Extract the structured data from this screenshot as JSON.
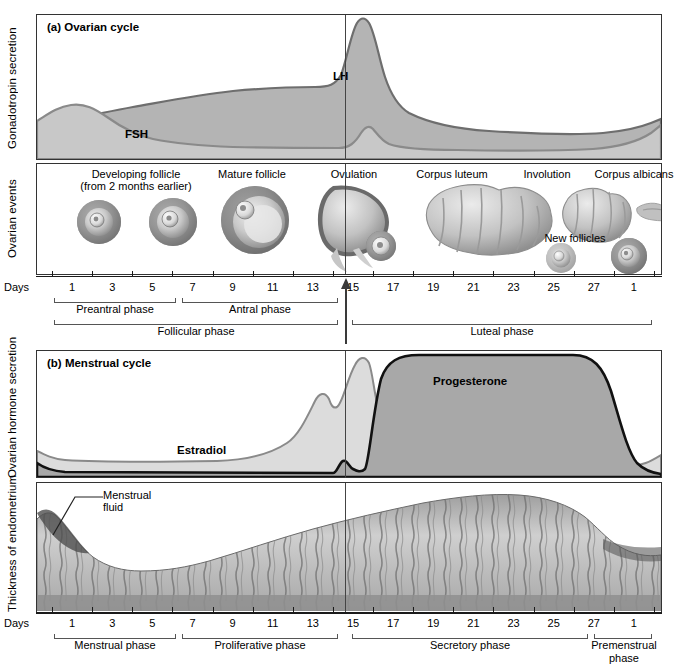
{
  "figure": {
    "type": "physiology-diagram",
    "panels": [
      {
        "id": "a",
        "label": "(a) Ovarian cycle"
      },
      {
        "id": "b",
        "label": "(b) Menstrual cycle"
      }
    ]
  },
  "axes": {
    "y_gonadotropin": "Gonadotropin secretion",
    "y_ovarian_events": "Ovarian events",
    "y_ovarian_hormone": "Ovarian hormone secretion",
    "y_endometrium": "Thickness of endometrium",
    "days_word": "Days",
    "day_ticks": [
      1,
      3,
      5,
      7,
      9,
      11,
      13,
      15,
      17,
      19,
      21,
      23,
      25,
      27,
      1
    ],
    "ovulation_day": 14
  },
  "panel_a": {
    "title": "(a) Ovarian cycle",
    "curves": [
      {
        "name": "LH",
        "label": "LH",
        "fill": "#b4b4b4",
        "stroke": "#6e6e6e"
      },
      {
        "name": "FSH",
        "label": "FSH",
        "fill": "#c8c8c8",
        "stroke": "#8a8a8a"
      }
    ],
    "events": [
      {
        "label": "Developing follicle",
        "sublabel": "(from 2 months earlier)"
      },
      {
        "label": "Mature follicle"
      },
      {
        "label": "Ovulation"
      },
      {
        "label": "Corpus luteum"
      },
      {
        "label": "Involution"
      },
      {
        "label": "Corpus albicans"
      },
      {
        "label": "New follicles"
      }
    ],
    "phases": [
      {
        "label": "Preantral phase",
        "start_day": 1,
        "end_day": 5
      },
      {
        "label": "Antral phase",
        "start_day": 6,
        "end_day": 13
      },
      {
        "label": "Follicular phase",
        "start_day": 1,
        "end_day": 13
      },
      {
        "label": "Luteal phase",
        "start_day": 15,
        "end_day": 28
      }
    ]
  },
  "panel_b": {
    "title": "(b) Menstrual cycle",
    "curves": [
      {
        "name": "Estradiol",
        "label": "Estradiol",
        "fill": "#dcdcdc",
        "stroke": "#8a8a8a"
      },
      {
        "name": "Progesterone",
        "label": "Progesterone",
        "fill": "#a8a8a8",
        "stroke": "#111111"
      }
    ],
    "annotations": [
      {
        "label": "Menstrual",
        "sublabel": "fluid"
      }
    ],
    "phases": [
      {
        "label": "Menstrual phase",
        "start_day": 1,
        "end_day": 5
      },
      {
        "label": "Proliferative phase",
        "start_day": 6,
        "end_day": 13
      },
      {
        "label": "Secretory phase",
        "start_day": 15,
        "end_day": 25
      },
      {
        "label": "Premenstrual phase",
        "start_day": 26,
        "end_day": 28
      }
    ]
  },
  "chart_data": [
    {
      "type": "area",
      "title": "(a) Ovarian cycle",
      "xlabel": "Days",
      "ylabel": "Gonadotropin secretion",
      "x": [
        1,
        3,
        5,
        7,
        9,
        11,
        13,
        14,
        15,
        17,
        19,
        21,
        23,
        25,
        27,
        28
      ],
      "series": [
        {
          "name": "LH",
          "values": [
            28,
            26,
            27,
            33,
            38,
            40,
            44,
            96,
            70,
            48,
            40,
            35,
            30,
            27,
            30,
            36
          ]
        },
        {
          "name": "FSH",
          "values": [
            34,
            42,
            34,
            24,
            19,
            16,
            15,
            38,
            20,
            14,
            13,
            12,
            12,
            14,
            22,
            30
          ]
        }
      ],
      "grid": false,
      "legend": "inline-labels"
    },
    {
      "type": "area",
      "title": "(b) Menstrual cycle",
      "xlabel": "Days",
      "ylabel": "Ovarian hormone secretion",
      "x": [
        1,
        3,
        5,
        7,
        9,
        11,
        13,
        14,
        15,
        17,
        19,
        21,
        23,
        25,
        27,
        28
      ],
      "series": [
        {
          "name": "Estradiol",
          "values": [
            22,
            14,
            14,
            15,
            17,
            30,
            72,
            88,
            42,
            55,
            57,
            57,
            57,
            55,
            26,
            16
          ]
        },
        {
          "name": "Progesterone",
          "values": [
            10,
            3,
            3,
            3,
            3,
            3,
            4,
            10,
            88,
            96,
            97,
            97,
            97,
            94,
            30,
            8
          ]
        }
      ],
      "grid": false,
      "legend": "inline-labels"
    },
    {
      "type": "area",
      "title": "Thickness of endometrium",
      "xlabel": "Days",
      "ylabel": "Thickness of endometrium",
      "x": [
        1,
        3,
        5,
        7,
        9,
        11,
        13,
        15,
        17,
        19,
        21,
        23,
        25,
        27,
        28
      ],
      "series": [
        {
          "name": "Endometrium thickness",
          "values": [
            70,
            40,
            22,
            26,
            34,
            42,
            50,
            62,
            76,
            86,
            92,
            92,
            86,
            72,
            66
          ]
        }
      ],
      "grid": false
    }
  ]
}
